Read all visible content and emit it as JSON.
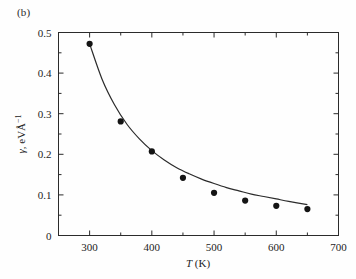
{
  "figure": {
    "panel_label": "(b)",
    "background_color": "#fefefe",
    "line_color": "#2b2b2b",
    "marker_color": "#141414"
  },
  "chart_data": {
    "type": "scatter",
    "title": "",
    "subtitle": "",
    "xlabel": "T (K)",
    "xlabel_italic_part": "T",
    "xlabel_rest": " (K)",
    "ylabel": "γ, eV·Å⁻¹",
    "ylabel_symbol": "γ",
    "ylabel_units": ", eVÅ",
    "ylabel_exponent": "−1",
    "xlim": [
      250,
      700
    ],
    "ylim": [
      0,
      0.5
    ],
    "xticks": [
      300,
      400,
      500,
      600,
      700
    ],
    "xticklabels": [
      "300",
      "400",
      "500",
      "600",
      "700"
    ],
    "xticks_minor": [
      250,
      350,
      450,
      550,
      650
    ],
    "yticks": [
      0,
      0.1,
      0.2,
      0.3,
      0.4,
      0.5
    ],
    "yticklabels": [
      "0",
      "0.1",
      "0.2",
      "0.3",
      "0.4",
      "0.5"
    ],
    "yticks_minor": [
      0.05,
      0.15,
      0.25,
      0.35,
      0.45
    ],
    "grid": false,
    "legend": null,
    "x": [
      300,
      350,
      400,
      450,
      500,
      550,
      600,
      650
    ],
    "values": [
      0.472,
      0.281,
      0.207,
      0.142,
      0.105,
      0.086,
      0.073,
      0.065
    ],
    "series": [
      {
        "name": "data points",
        "marker": "filled-circle",
        "x": [
          300,
          350,
          400,
          450,
          500,
          550,
          600,
          650
        ],
        "values": [
          0.472,
          0.281,
          0.207,
          0.142,
          0.105,
          0.086,
          0.073,
          0.065
        ]
      },
      {
        "name": "fitted curve",
        "marker": "none",
        "x": [
          300,
          320,
          340,
          360,
          380,
          400,
          420,
          440,
          460,
          480,
          500,
          520,
          540,
          560,
          580,
          600,
          620,
          650
        ],
        "values": [
          0.472,
          0.385,
          0.322,
          0.274,
          0.238,
          0.209,
          0.186,
          0.167,
          0.152,
          0.139,
          0.128,
          0.118,
          0.11,
          0.102,
          0.096,
          0.09,
          0.084,
          0.076
        ]
      }
    ]
  }
}
